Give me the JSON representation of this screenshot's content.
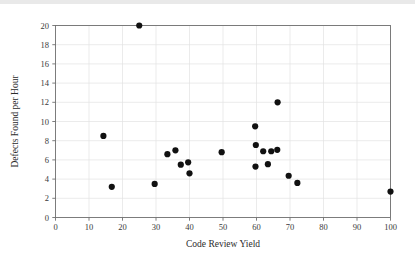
{
  "chart_data": {
    "type": "scatter",
    "title": "",
    "xlabel": "Code Review Yield",
    "ylabel": "Defects Found per Hour",
    "xlim": [
      0,
      100
    ],
    "ylim": [
      0,
      20
    ],
    "xticks": [
      0,
      10,
      20,
      30,
      40,
      50,
      60,
      70,
      80,
      90,
      100
    ],
    "yticks": [
      0,
      2,
      4,
      6,
      8,
      10,
      12,
      14,
      16,
      18,
      20
    ],
    "xtick_labels": [
      "0",
      "10",
      "20",
      "30",
      "40",
      "50",
      "60",
      "70",
      "80",
      "90",
      "100"
    ],
    "ytick_labels": [
      "0",
      "2",
      "4",
      "6",
      "8",
      "10",
      "12",
      "14",
      "16",
      "18",
      "20"
    ],
    "grid": true,
    "legend": null,
    "legend_position": "none",
    "marker": "filled-circle",
    "marker_color": "#111111",
    "marker_size": 3.1,
    "points": [
      {
        "x": 14.3,
        "y": 8.5
      },
      {
        "x": 16.8,
        "y": 3.2
      },
      {
        "x": 25.0,
        "y": 20.0
      },
      {
        "x": 29.6,
        "y": 3.5
      },
      {
        "x": 33.4,
        "y": 6.6
      },
      {
        "x": 35.8,
        "y": 7.0
      },
      {
        "x": 37.4,
        "y": 5.5
      },
      {
        "x": 39.6,
        "y": 5.75
      },
      {
        "x": 40.0,
        "y": 4.6
      },
      {
        "x": 49.6,
        "y": 6.8
      },
      {
        "x": 59.6,
        "y": 9.5
      },
      {
        "x": 59.8,
        "y": 7.55
      },
      {
        "x": 59.7,
        "y": 5.3
      },
      {
        "x": 62.0,
        "y": 6.9
      },
      {
        "x": 63.4,
        "y": 5.55
      },
      {
        "x": 64.4,
        "y": 6.9
      },
      {
        "x": 66.2,
        "y": 7.05
      },
      {
        "x": 66.3,
        "y": 12.0
      },
      {
        "x": 69.6,
        "y": 4.35
      },
      {
        "x": 72.2,
        "y": 3.6
      },
      {
        "x": 100.0,
        "y": 2.7
      }
    ]
  },
  "figure": {
    "background_color": "#ffffff",
    "frame_color": "#6f6f6f",
    "grid_color": "#e2e2e2",
    "text_color": "#2b2b2b"
  }
}
